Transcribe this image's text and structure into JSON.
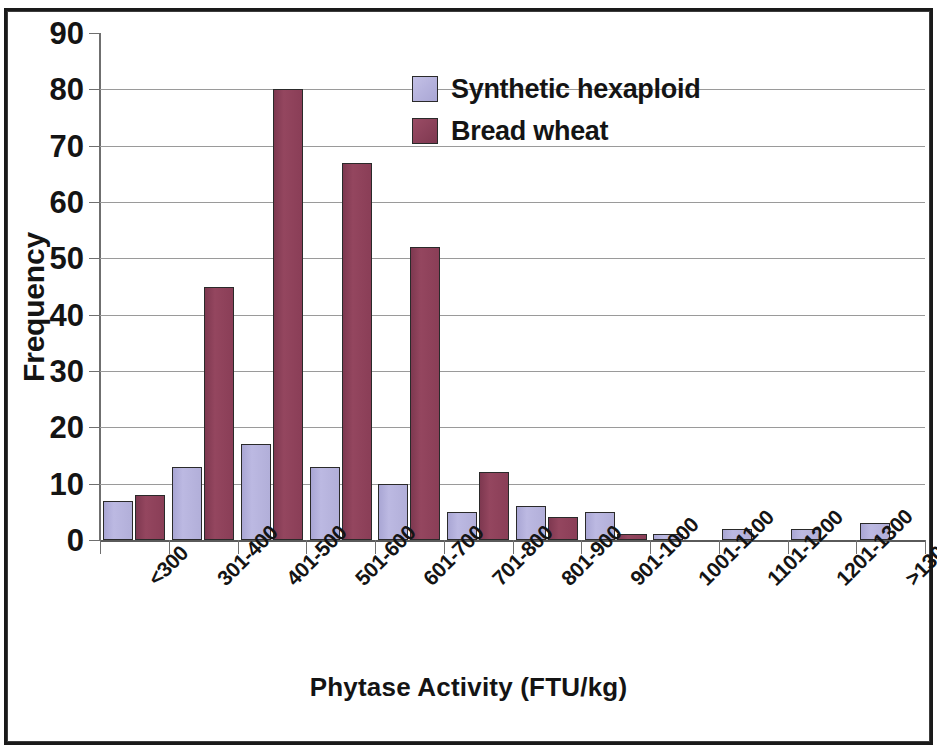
{
  "chart_data": {
    "type": "bar",
    "title": "",
    "xlabel": "Phytase Activity (FTU/kg)",
    "ylabel": "Frequency",
    "ylim": [
      0,
      90
    ],
    "y_ticks": [
      0,
      10,
      20,
      30,
      40,
      50,
      60,
      70,
      80,
      90
    ],
    "grid": true,
    "legend_position": "top-center-right",
    "categories": [
      "<300",
      "301-400",
      "401-500",
      "501-600",
      "601-700",
      "701-800",
      "801-900",
      "901-1000",
      "1001-1100",
      "1101-1200",
      "1201-1300",
      ">1300"
    ],
    "series": [
      {
        "name": "Synthetic hexaploid",
        "color": "#b6b3dd",
        "values": [
          7,
          13,
          17,
          13,
          10,
          5,
          6,
          5,
          1,
          2,
          2,
          3
        ]
      },
      {
        "name": "Bread wheat",
        "color": "#8d4059",
        "values": [
          8,
          45,
          80,
          67,
          52,
          12,
          4,
          1,
          0,
          0,
          0,
          0
        ]
      }
    ]
  },
  "axes": {
    "y_title": "Frequency",
    "x_title": "Phytase Activity (FTU/kg)"
  },
  "legend": {
    "items": [
      {
        "label": "Synthetic hexaploid",
        "color": "#b6b3dd",
        "key": "synthetic"
      },
      {
        "label": "Bread wheat",
        "color": "#8d4059",
        "key": "bread"
      }
    ]
  },
  "colors": {
    "synthetic_hexaploid": "#b6b3dd",
    "bread_wheat": "#8d4059",
    "gridline": "#9a9a9a",
    "axis": "#6f6f6f",
    "text": "#141414",
    "background": "#ffffff",
    "frame": "#1a1a1a"
  }
}
